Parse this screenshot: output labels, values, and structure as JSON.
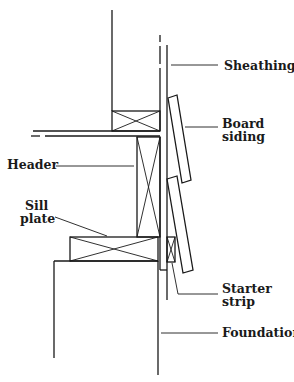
{
  "diagram": {
    "labels": {
      "sheathing": "Sheathing",
      "board_siding_1": "Board",
      "board_siding_2": "siding",
      "header": "Header",
      "sill_plate_1": "Sill",
      "sill_plate_2": "plate",
      "starter_strip_1": "Starter",
      "starter_strip_2": "strip",
      "foundation": "Foundation"
    },
    "colors": {
      "line": "#1a1a1a",
      "background": "#ffffff"
    }
  }
}
